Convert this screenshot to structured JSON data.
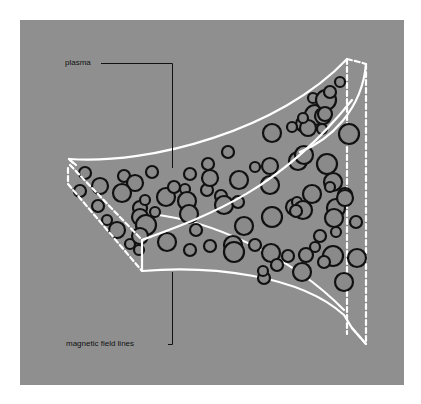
{
  "labels": {
    "plasma": "plasma",
    "magnetic_field_lines": "magnetic field lines"
  },
  "colors": {
    "background": "#8f8f8f",
    "outline": "#ffffff",
    "particle_stroke": "#111111",
    "particle_fill": "#8a8a8a",
    "leader": "#111111"
  },
  "particles": [
    [
      85,
      173,
      6
    ],
    [
      100,
      186,
      8
    ],
    [
      124,
      176,
      6
    ],
    [
      135,
      183,
      8
    ],
    [
      122,
      193,
      9
    ],
    [
      152,
      172,
      6
    ],
    [
      80,
      191,
      6
    ],
    [
      98,
      206,
      6
    ],
    [
      107,
      220,
      5
    ],
    [
      117,
      230,
      8
    ],
    [
      130,
      244,
      5
    ],
    [
      139,
      250,
      5
    ],
    [
      140,
      208,
      7
    ],
    [
      145,
      200,
      5
    ],
    [
      140,
      217,
      8
    ],
    [
      146,
      225,
      10
    ],
    [
      140,
      236,
      8
    ],
    [
      155,
      212,
      5
    ],
    [
      166,
      197,
      9
    ],
    [
      174,
      187,
      6
    ],
    [
      185,
      189,
      5
    ],
    [
      190,
      174,
      6
    ],
    [
      187,
      201,
      9
    ],
    [
      189,
      214,
      9
    ],
    [
      196,
      230,
      6
    ],
    [
      207,
      190,
      6
    ],
    [
      210,
      178,
      8
    ],
    [
      208,
      164,
      6
    ],
    [
      228,
      152,
      6
    ],
    [
      221,
      196,
      6
    ],
    [
      224,
      205,
      9
    ],
    [
      239,
      180,
      9
    ],
    [
      255,
      167,
      5
    ],
    [
      270,
      166,
      8
    ],
    [
      270,
      185,
      9
    ],
    [
      238,
      202,
      6
    ],
    [
      244,
      226,
      9
    ],
    [
      233,
      245,
      9
    ],
    [
      255,
      245,
      6
    ],
    [
      272,
      217,
      10
    ],
    [
      271,
      253,
      9
    ],
    [
      264,
      278,
      6
    ],
    [
      277,
      265,
      6
    ],
    [
      294,
      207,
      8
    ],
    [
      297,
      202,
      5
    ],
    [
      303,
      210,
      9
    ],
    [
      302,
      272,
      9
    ],
    [
      296,
      211,
      6
    ],
    [
      298,
      161,
      9
    ],
    [
      304,
      155,
      9
    ],
    [
      312,
      194,
      9
    ],
    [
      333,
      182,
      9
    ],
    [
      327,
      164,
      10
    ],
    [
      330,
      187,
      5
    ],
    [
      336,
      208,
      9
    ],
    [
      345,
      195,
      7
    ],
    [
      336,
      232,
      5
    ],
    [
      345,
      198,
      8
    ],
    [
      334,
      218,
      9
    ],
    [
      304,
      124,
      8
    ],
    [
      315,
      115,
      10
    ],
    [
      322,
      129,
      5
    ],
    [
      323,
      116,
      8
    ],
    [
      308,
      128,
      8
    ],
    [
      303,
      118,
      5
    ],
    [
      313,
      98,
      5
    ],
    [
      326,
      100,
      10
    ],
    [
      330,
      92,
      6
    ],
    [
      340,
      82,
      5
    ],
    [
      325,
      114,
      7
    ],
    [
      272,
      133,
      9
    ],
    [
      292,
      127,
      5
    ],
    [
      349,
      134,
      10
    ],
    [
      333,
      256,
      10
    ],
    [
      344,
      282,
      9
    ],
    [
      315,
      247,
      5
    ],
    [
      324,
      262,
      6
    ],
    [
      306,
      255,
      7
    ],
    [
      288,
      256,
      6
    ],
    [
      167,
      242,
      9
    ],
    [
      190,
      250,
      6
    ],
    [
      210,
      246,
      6
    ],
    [
      234,
      252,
      10
    ],
    [
      263,
      271,
      5
    ],
    [
      320,
      236,
      6
    ],
    [
      356,
      222,
      6
    ],
    [
      357,
      258,
      9
    ]
  ]
}
